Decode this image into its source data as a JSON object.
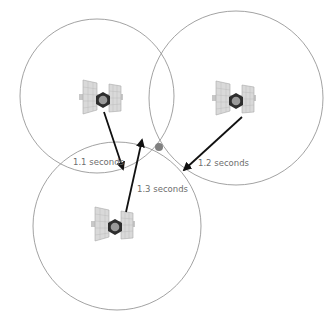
{
  "diagram": {
    "title": "",
    "satellites": [
      {
        "id": "sat-1",
        "name": "Satellite 1",
        "signal_time": "1.1 seconds"
      },
      {
        "id": "sat-2",
        "name": "Satellite 2",
        "signal_time": "1.2 seconds"
      },
      {
        "id": "sat-3",
        "name": "Satellite 3",
        "signal_time": "1.3 seconds"
      }
    ],
    "receiver": {
      "name": "Receiver position (intersection point)"
    },
    "colors": {
      "circle": "#8a8a8a",
      "arrow": "#111111",
      "receiver_dot": "#808080",
      "label": "#6e6e6e"
    }
  }
}
